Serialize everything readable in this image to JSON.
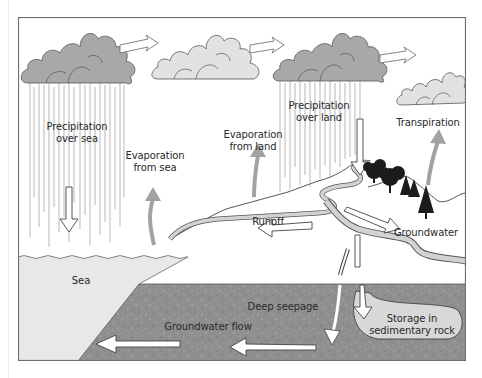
{
  "diagram": {
    "type": "water-cycle",
    "colors": {
      "frame": "#6e6e6e",
      "dark_cloud": "#a8a8a8",
      "light_cloud": "#e2e2e2",
      "sea": "#e8e8e8",
      "bedrock": "#8f8f8f",
      "water_channel": "#d2d2d2",
      "evap_arrow": "#a2a2a2",
      "trees": "#1c1c1c"
    },
    "labels": {
      "precip_sea": [
        "Precipitation",
        "over sea"
      ],
      "evap_sea": [
        "Evaporation",
        "from sea"
      ],
      "evap_land": [
        "Evaporation",
        "from land"
      ],
      "precip_land": [
        "Precipitation",
        "over land"
      ],
      "transpiration": "Transpiration",
      "runoff": "Runoff",
      "groundwater": "Groundwater",
      "sea": "Sea",
      "deep_seepage": "Deep seepage",
      "groundwater_flow": "Groundwater flow",
      "storage": [
        "Storage in",
        "sedimentary rock"
      ]
    },
    "clouds": [
      {
        "name": "rain-cloud-sea",
        "shade": "dark"
      },
      {
        "name": "cloud-drifting",
        "shade": "light"
      },
      {
        "name": "rain-cloud-land",
        "shade": "dark"
      },
      {
        "name": "cloud-transpiration",
        "shade": "light"
      }
    ]
  }
}
